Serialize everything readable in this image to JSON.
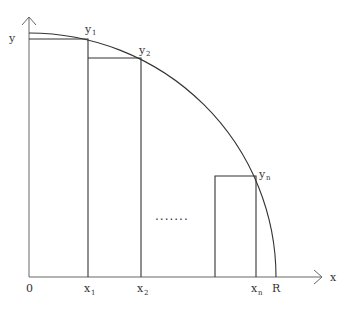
{
  "diagram": {
    "type": "riemann-sum-quarter-circle",
    "axes": {
      "x_label": "x",
      "y_label": "y",
      "origin_label": "0"
    },
    "x_ticks": [
      {
        "base": "x",
        "sub": "1"
      },
      {
        "base": "x",
        "sub": "2"
      },
      {
        "base": "x",
        "sub": "n"
      }
    ],
    "radius_label": "R",
    "y_points": [
      {
        "base": "y",
        "sub": "1"
      },
      {
        "base": "y",
        "sub": "2"
      },
      {
        "base": "y",
        "sub": "n"
      }
    ],
    "ellipsis": "·······",
    "colors": {
      "lines": "#333333",
      "axes": "#666666",
      "background": "#ffffff"
    }
  }
}
